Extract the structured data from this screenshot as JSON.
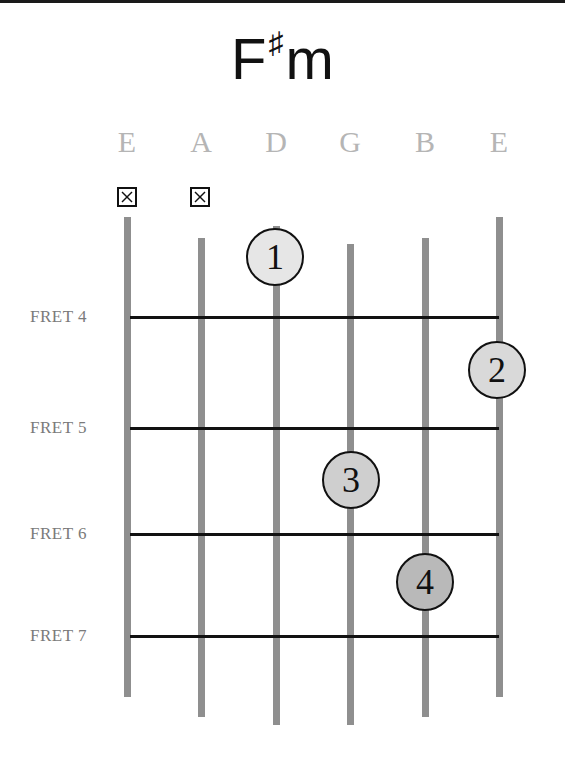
{
  "chord": {
    "root": "F",
    "accidental": "♯",
    "quality": "m",
    "name": "F♯m"
  },
  "strings": [
    {
      "name": "E",
      "x": 127,
      "top": 217,
      "bottom": 697,
      "muted": true
    },
    {
      "name": "A",
      "x": 201,
      "top": 238,
      "bottom": 717,
      "muted": true
    },
    {
      "name": "D",
      "x": 276,
      "top": 226,
      "bottom": 725,
      "muted": false
    },
    {
      "name": "G",
      "x": 350,
      "top": 244,
      "bottom": 725,
      "muted": false
    },
    {
      "name": "B",
      "x": 425,
      "top": 238,
      "bottom": 717,
      "muted": false
    },
    {
      "name": "E",
      "x": 499,
      "top": 217,
      "bottom": 697,
      "muted": false
    }
  ],
  "frets": [
    {
      "label": "FRET 4",
      "y": 317
    },
    {
      "label": "FRET 5",
      "y": 428
    },
    {
      "label": "FRET 6",
      "y": 534
    },
    {
      "label": "FRET 7",
      "y": 636
    }
  ],
  "fingers": [
    {
      "finger": "1",
      "string": "D",
      "x": 275,
      "y": 257,
      "fill": "#e6e6e6"
    },
    {
      "finger": "2",
      "string": "E",
      "x": 497,
      "y": 370,
      "fill": "#d9d9d9"
    },
    {
      "finger": "3",
      "string": "G",
      "x": 351,
      "y": 480,
      "fill": "#cfcfcf"
    },
    {
      "finger": "4",
      "string": "B",
      "x": 425,
      "y": 582,
      "fill": "#b9b9b9"
    }
  ],
  "colors": {
    "string": "#8f8f8f",
    "fret": "#111111",
    "string_label": "#b5b5b5",
    "fret_label": "#7a7a7a"
  }
}
